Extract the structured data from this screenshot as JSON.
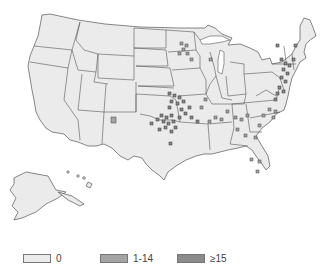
{
  "map": {
    "region": "United States",
    "unit": "county",
    "colors": {
      "background": "#ffffff",
      "state_fill": "#ebebeb",
      "border": "#555555",
      "class_1_14": "#a4a4a4",
      "class_15plus": "#8a8a8a"
    }
  },
  "legend": {
    "items": [
      {
        "label": "0",
        "color": "#ebebeb"
      },
      {
        "label": "1-14",
        "color": "#a4a4a4"
      },
      {
        "label": "≥15",
        "color": "#8a8a8a"
      }
    ]
  }
}
